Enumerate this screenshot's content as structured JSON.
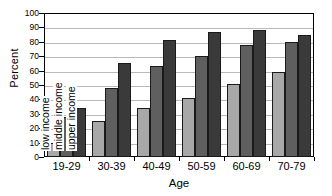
{
  "chart_data": {
    "type": "bar",
    "title": "",
    "xlabel": "Age",
    "ylabel": "Percent",
    "categories": [
      "19-29",
      "30-39",
      "40-49",
      "50-59",
      "60-69",
      "70-79"
    ],
    "series": [
      {
        "name": "low income",
        "color": "#a8a8a8",
        "values": [
          10,
          25,
          34,
          41,
          51,
          59
        ]
      },
      {
        "name": "middle income",
        "color": "#5f5f5f",
        "values": [
          28,
          48,
          63,
          70,
          78,
          80
        ]
      },
      {
        "name": "upper income",
        "color": "#3a3a3a",
        "values": [
          34,
          65,
          81,
          87,
          88,
          85
        ]
      }
    ],
    "ylim": [
      0,
      100
    ],
    "yticks": [
      0,
      10,
      20,
      30,
      40,
      50,
      60,
      70,
      80,
      90,
      100
    ],
    "ytick_labels": [
      "0",
      "10",
      "20",
      "30",
      "40",
      "50",
      "60",
      "70",
      "80",
      "90",
      "100"
    ],
    "grid": true,
    "grid_axis": "y",
    "legend_position": "inside-plot-rotated",
    "legend_anchor_group": "19-29"
  }
}
